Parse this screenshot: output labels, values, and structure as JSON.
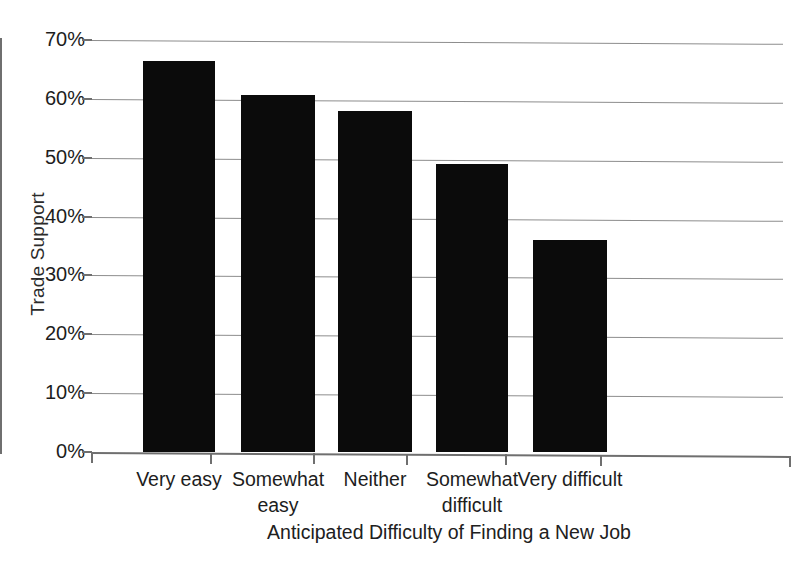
{
  "chart_data": {
    "type": "bar",
    "title": "",
    "subtitle": "",
    "xlabel": "Anticipated Difficulty of Finding a New Job",
    "ylabel": "Trade Support",
    "categories": [
      "Very easy",
      "Somewhat easy",
      "Neither",
      "Somewhat difficult",
      "Very difficult"
    ],
    "category_lines": [
      [
        "Very easy",
        ""
      ],
      [
        "Somewhat",
        "easy"
      ],
      [
        "Neither",
        ""
      ],
      [
        "Somewhat",
        "difficult"
      ],
      [
        "Very difficult",
        ""
      ]
    ],
    "values": [
      66.4,
      60.7,
      58.0,
      49.0,
      36.0
    ],
    "value_labels": [
      "66%",
      "61%",
      "58%",
      "49%",
      "36%"
    ],
    "ylim": [
      0,
      70
    ],
    "ytick_values": [
      0,
      10,
      20,
      30,
      40,
      50,
      60,
      70
    ],
    "ytick_labels": [
      "0%",
      "10%",
      "20%",
      "30%",
      "40%",
      "50%",
      "60%",
      "70%"
    ],
    "grid": true,
    "grid_axis": "y",
    "legend": false,
    "legend_position": "none",
    "bar_color": "#0b0b0b",
    "gridline_color": "#8d8d8d",
    "axis_color": "#6f6f6f",
    "background_color": "#ffffff"
  }
}
